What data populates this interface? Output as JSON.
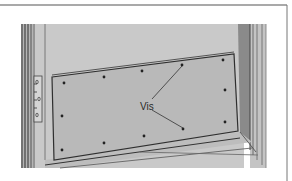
{
  "figure": {
    "label": "Vis",
    "colors": {
      "background": "#ffffff",
      "door": "#c9c9c9",
      "plate": "#b9b9b9",
      "frame_dark": "#6e6e6e",
      "line": "#3a3a3a",
      "border": "#555555"
    },
    "screws": [
      {
        "x": 64,
        "y": 83
      },
      {
        "x": 104,
        "y": 77
      },
      {
        "x": 142,
        "y": 71
      },
      {
        "x": 182,
        "y": 65
      },
      {
        "x": 223,
        "y": 60
      },
      {
        "x": 225,
        "y": 90
      },
      {
        "x": 225,
        "y": 122
      },
      {
        "x": 183,
        "y": 129
      },
      {
        "x": 144,
        "y": 136
      },
      {
        "x": 104,
        "y": 143
      },
      {
        "x": 62,
        "y": 150
      },
      {
        "x": 62,
        "y": 116
      }
    ]
  }
}
